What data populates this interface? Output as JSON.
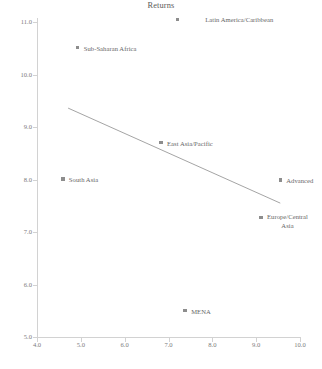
{
  "chart_data": {
    "type": "scatter",
    "title": "Returns",
    "xlabel": "",
    "ylabel": "",
    "xlim": [
      4.0,
      10.0
    ],
    "ylim": [
      5.0,
      11.0
    ],
    "grid": false,
    "legend": "none",
    "xticks": [
      "4.0",
      "5.0",
      "6.0",
      "7.0",
      "8.0",
      "9.0",
      "10.0"
    ],
    "xtick_values": [
      4.0,
      5.0,
      6.0,
      7.0,
      8.0,
      9.0,
      10.0
    ],
    "yticks": [
      "5.0",
      "6.0",
      "7.0",
      "8.0",
      "9.0",
      "10.0",
      "11.0"
    ],
    "ytick_values": [
      5.0,
      6.0,
      7.0,
      8.0,
      9.0,
      10.0,
      11.0
    ],
    "marker_color": "#8d8d8d",
    "line_color": "#9a9a9a",
    "axis_color": "#d2d2d2",
    "text_color": "#666666",
    "points": [
      {
        "label": "Latin America/Caribbean",
        "x": 7.2,
        "y": 11.05,
        "label_dx": 28,
        "label_dy": -3,
        "lines": 1
      },
      {
        "label": "Sub-Saharan Africa",
        "x": 4.93,
        "y": 10.51,
        "label_dx": 6,
        "label_dy": -3,
        "lines": 1
      },
      {
        "label": "East Asia/Pacific",
        "x": 6.83,
        "y": 8.7,
        "label_dx": 6,
        "label_dy": -3,
        "lines": 1
      },
      {
        "label": "South Asia",
        "x": 4.59,
        "y": 8.01,
        "label_dx": 6,
        "label_dy": -3,
        "lines": 1
      },
      {
        "label": "Advanced",
        "x": 9.55,
        "y": 7.99,
        "label_dx": 6,
        "label_dy": -3,
        "lines": 1
      },
      {
        "label": "Europe/Central\nAsia",
        "x": 9.11,
        "y": 7.28,
        "label_dx": 6,
        "label_dy": -4,
        "lines": 2
      },
      {
        "label": "MENA",
        "x": 7.38,
        "y": 5.5,
        "label_dx": 6,
        "label_dy": -3,
        "lines": 1
      }
    ],
    "trend_line": {
      "x0": 4.71,
      "y0": 9.36,
      "x1": 9.55,
      "y1": 7.55
    }
  }
}
